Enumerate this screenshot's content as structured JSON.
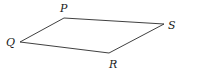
{
  "diagram": {
    "type": "quadrilateral",
    "vertices": [
      {
        "name": "P",
        "x": 64,
        "y": 18,
        "label_x": 60,
        "label_y": 12
      },
      {
        "name": "S",
        "x": 164,
        "y": 24,
        "label_x": 168,
        "label_y": 29
      },
      {
        "name": "R",
        "x": 109,
        "y": 53,
        "label_x": 109,
        "label_y": 68
      },
      {
        "name": "Q",
        "x": 20,
        "y": 42,
        "label_x": 6,
        "label_y": 46
      }
    ],
    "edges": [
      [
        "P",
        "S"
      ],
      [
        "S",
        "R"
      ],
      [
        "R",
        "Q"
      ],
      [
        "Q",
        "P"
      ]
    ],
    "labels": {
      "P": "P",
      "S": "S",
      "R": "R",
      "Q": "Q"
    },
    "colors": {
      "line": "#2a2a2a",
      "text": "#1a1a1a",
      "background": "#ffffff"
    }
  }
}
